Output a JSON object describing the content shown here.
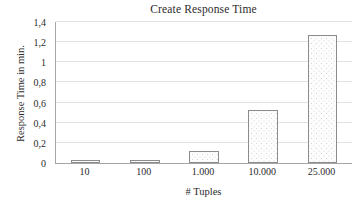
{
  "chart_data": {
    "type": "bar",
    "title": "Create Response Time",
    "xlabel": "# Tuples",
    "ylabel": "Response Time in min.",
    "categories": [
      "10",
      "100",
      "1.000",
      "10.000",
      "25.000"
    ],
    "values": [
      0.03,
      0.03,
      0.12,
      0.53,
      1.27
    ],
    "ylim": [
      0,
      1.4
    ],
    "yticks": [
      0,
      0.2,
      0.4,
      0.6,
      0.8,
      1.0,
      1.2,
      1.4
    ],
    "ytick_labels": [
      "0",
      "0,2",
      "0,4",
      "0,6",
      "0,8",
      "1",
      "1,2",
      "1,4"
    ],
    "grid": "horizontal",
    "legend": "none",
    "bar_fill": "#fdfdfd",
    "bar_border": "#8c8c8c",
    "grid_color": "#e2e2e2",
    "axis_color": "#a6a6a6",
    "text_color": "#2b2b2b"
  }
}
